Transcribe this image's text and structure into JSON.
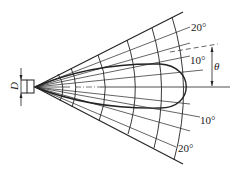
{
  "diagram": {
    "labels": {
      "diameter": "D",
      "angle_symbol": "θ",
      "upper_20": "20°",
      "upper_10": "10°",
      "lower_10": "10°",
      "lower_20": "20°"
    },
    "caption": "",
    "colors": {
      "line": "#222222",
      "background": "#ffffff"
    }
  }
}
